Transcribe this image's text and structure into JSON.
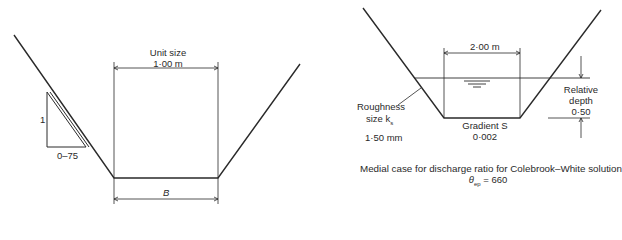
{
  "left_figure": {
    "unit_size_label": "Unit size",
    "unit_size_value": "1·00 m",
    "slope_rise": "1",
    "slope_run": "0–75",
    "base_width_label": "B"
  },
  "right_figure": {
    "top_width": "2·00 m",
    "roughness_label_line1": "Roughness",
    "roughness_label_line2": "size k",
    "roughness_subscript": "s",
    "roughness_value": "1·50 mm",
    "gradient_label": "Gradient S",
    "gradient_value": "0·002",
    "relative_depth_line1": "Relative",
    "relative_depth_line2": "depth",
    "relative_depth_value": "0·50",
    "caption": "Medial case for discharge ratio for Colebrook–White solutions",
    "theta_symbol": "θ",
    "theta_subscript": "ep",
    "theta_value": "= 660"
  }
}
